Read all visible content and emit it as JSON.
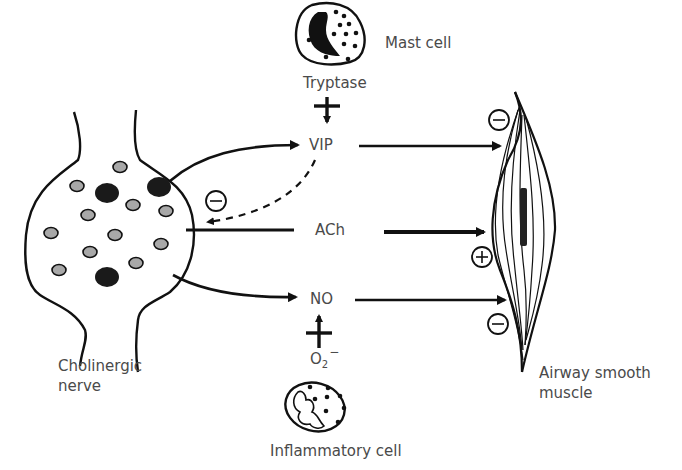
{
  "labels": {
    "mast_cell": "Mast cell",
    "tryptase": "Tryptase",
    "vip": "VIP",
    "ach": "ACh",
    "no": "NO",
    "o2_base": "O",
    "o2_sub": "2",
    "o2_sup": "−",
    "inflammatory_cell": "Inflammatory cell",
    "cholinergic_line1": "Cholinergic",
    "cholinergic_line2": "nerve",
    "airway_line1": "Airway smooth",
    "airway_line2": "muscle"
  },
  "signs": {
    "vip_effect": "−",
    "ach_effect": "+",
    "no_effect": "−",
    "vip_feedback": "−"
  },
  "colors": {
    "stroke": "#111111",
    "text": "#4a4a4a",
    "vesicle_fill": "#a8a8a8",
    "vesicle_dark": "#1a1a1a"
  }
}
